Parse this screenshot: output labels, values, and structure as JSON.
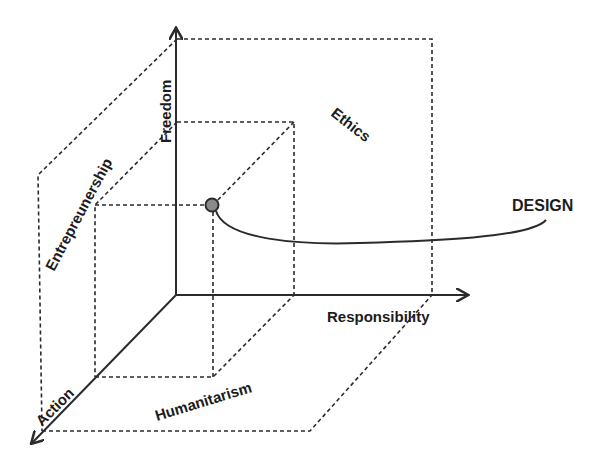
{
  "diagram": {
    "type": "3d-axes-concept",
    "axes": {
      "vertical": "Freedom",
      "horizontal": "Responsibility",
      "depth": "Action"
    },
    "planes": {
      "vertical_depth": "Entrepreunership",
      "vertical_horizontal": "Ethics",
      "horizontal_depth": "Humanitarism"
    },
    "point_label": "DESIGN",
    "colors": {
      "line": "#2b2b2b",
      "point_fill": "#8a8a8a",
      "background": "#ffffff"
    }
  }
}
